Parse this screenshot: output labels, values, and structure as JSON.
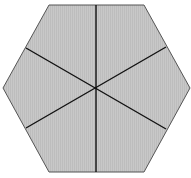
{
  "diagram": {
    "shape": "regular-hexagon",
    "divisions": 6,
    "fill_color": "#c4c4c4",
    "stroke_color": "#555555",
    "divider_color": "#111111",
    "vertices": [
      [
        49,
        5
      ],
      [
        144,
        5
      ],
      [
        190,
        88
      ],
      [
        144,
        172
      ],
      [
        49,
        172
      ],
      [
        3,
        88
      ]
    ],
    "center": [
      96,
      88
    ],
    "dividers": [
      [
        [
          96,
          5
        ],
        [
          96,
          172
        ]
      ],
      [
        [
          26,
          48
        ],
        [
          166,
          129
        ]
      ],
      [
        [
          26,
          128
        ],
        [
          166,
          47
        ]
      ]
    ]
  }
}
